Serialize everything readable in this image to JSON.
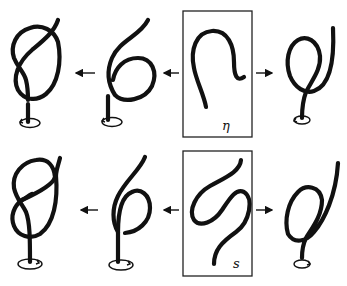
{
  "figure": {
    "rows": [
      {
        "id": "top",
        "label": "η",
        "description": "Central boxed curve η transformed into knot configurations",
        "panels": [
          "overhand-knot",
          "loop-with-tail",
          "eta-curve",
          "simple-loop"
        ]
      },
      {
        "id": "bottom",
        "label": "s",
        "description": "Central boxed curve s transformed into knot configurations",
        "panels": [
          "figure-knot",
          "loop-with-tail",
          "s-curve",
          "simple-loop"
        ]
      }
    ],
    "arrows": [
      {
        "row": "top",
        "direction": "left",
        "from": "box",
        "to": "loop-with-tail"
      },
      {
        "row": "top",
        "direction": "left",
        "from": "loop-with-tail",
        "to": "overhand-knot"
      },
      {
        "row": "top",
        "direction": "right",
        "from": "box",
        "to": "simple-loop"
      },
      {
        "row": "bottom",
        "direction": "left",
        "from": "box",
        "to": "loop-with-tail"
      },
      {
        "row": "bottom",
        "direction": "left",
        "from": "loop-with-tail",
        "to": "figure-knot"
      },
      {
        "row": "bottom",
        "direction": "right",
        "from": "box",
        "to": "simple-loop"
      }
    ],
    "colors": {
      "stroke": "#111111",
      "background": "#ffffff"
    }
  }
}
